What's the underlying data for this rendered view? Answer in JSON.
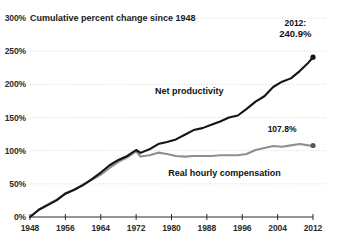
{
  "chart_data": {
    "type": "line",
    "title": "Cumulative percent change since 1948",
    "xlabel": "",
    "ylabel": "",
    "xlim": [
      1948,
      2012
    ],
    "ylim": [
      0,
      300
    ],
    "grid": true,
    "legend_position": "inline",
    "y_ticks": [
      "0%",
      "50%",
      "100%",
      "150%",
      "200%",
      "250%",
      "300%"
    ],
    "y_tick_values": [
      0,
      50,
      100,
      150,
      200,
      250,
      300
    ],
    "x_ticks": [
      "1948",
      "1956",
      "1964",
      "1972",
      "1980",
      "1988",
      "1996",
      "2004",
      "2012"
    ],
    "x_tick_values": [
      1948,
      1956,
      1964,
      1972,
      1980,
      1988,
      1996,
      2004,
      2012
    ],
    "series": [
      {
        "name": "Net productivity",
        "color": "#141414",
        "label_x": 1984,
        "label_y": 185,
        "end_value": 240.9,
        "end_year": 2012,
        "x": [
          1948,
          1950,
          1952,
          1954,
          1956,
          1958,
          1960,
          1962,
          1964,
          1966,
          1968,
          1970,
          1972,
          1973,
          1975,
          1977,
          1979,
          1981,
          1983,
          1985,
          1987,
          1989,
          1991,
          1993,
          1995,
          1997,
          1999,
          2001,
          2003,
          2005,
          2007,
          2009,
          2011,
          2012
        ],
        "values": [
          0,
          11,
          18,
          25,
          35,
          41,
          48,
          57,
          67,
          78,
          86,
          92,
          101,
          96.7,
          102,
          110,
          113,
          117,
          124,
          131,
          134,
          139,
          144,
          150,
          153,
          163,
          174,
          182,
          196,
          204,
          209,
          220,
          233,
          240.9
        ]
      },
      {
        "name": "Real hourly compensation",
        "color": "#8f8f8f",
        "label_x": 1992,
        "label_y": 62,
        "end_value": 107.8,
        "end_year": 2012,
        "x": [
          1948,
          1950,
          1952,
          1954,
          1956,
          1958,
          1960,
          1962,
          1964,
          1966,
          1968,
          1970,
          1972,
          1973,
          1975,
          1977,
          1979,
          1981,
          1983,
          1985,
          1987,
          1989,
          1991,
          1993,
          1995,
          1997,
          1999,
          2001,
          2003,
          2005,
          2007,
          2009,
          2011,
          2012
        ],
        "values": [
          0,
          11,
          19,
          26,
          36,
          41,
          49,
          56,
          64,
          74,
          83,
          90,
          99,
          91.3,
          93,
          97,
          95,
          92,
          91,
          92,
          92,
          92,
          93,
          93,
          93,
          95,
          101,
          104,
          107,
          106,
          108,
          110,
          108,
          107.8
        ]
      }
    ],
    "annotations": [
      {
        "name": "productivity-end-label-year",
        "text": "2012:",
        "x": 2008,
        "y": 288
      },
      {
        "name": "productivity-end-label-value",
        "text": "240.9%",
        "x": 2008,
        "y": 271
      },
      {
        "name": "compensation-end-label-value",
        "text": "107.8%",
        "x": 2005,
        "y": 128
      }
    ]
  }
}
